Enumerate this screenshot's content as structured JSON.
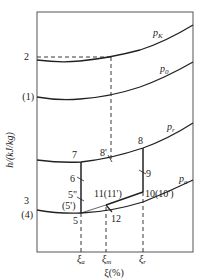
{
  "diagram": {
    "y_axis_label": "h/(kJ/kg)",
    "x_axis_label": "ξ(%)",
    "x_ticks": [
      {
        "main": "ξ",
        "sub": "a"
      },
      {
        "main": "ξ",
        "sub": "m"
      },
      {
        "main": "ξ",
        "sub": "r"
      }
    ],
    "left_labels": {
      "p2": "2",
      "p1": "(1)",
      "p3": "3",
      "p4": "(4)"
    },
    "curves": [
      {
        "main": "p",
        "sub": "K"
      },
      {
        "main": "p",
        "sub": "0"
      },
      {
        "main": "p",
        "sub": "r"
      },
      {
        "main": "p",
        "sub": "a"
      }
    ],
    "points": {
      "p5": "5",
      "p5pp": "5\"",
      "p5p": "(5')",
      "p6": "6",
      "p7": "7",
      "p8p": "8'",
      "p8": "8",
      "p9": "9",
      "p10": "10(10')",
      "p11": "11(11')",
      "p12": "12"
    },
    "colors": {
      "line": "#222222",
      "frame": "#555555"
    }
  }
}
